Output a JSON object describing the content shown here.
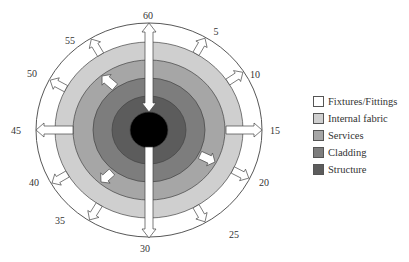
{
  "diagram": {
    "type": "concentric-layers-lifespan",
    "center": [
      149,
      130
    ],
    "outer_ring_label": "Fixtures/Fittings",
    "layers": [
      {
        "name": "Fixtures/Fittings",
        "color": "#ffffff",
        "rx": 113,
        "ry": 107
      },
      {
        "name": "Internal fabric",
        "color": "#cfcfcf",
        "rx": 94,
        "ry": 88
      },
      {
        "name": "Services",
        "color": "#a6a6a6",
        "rx": 76,
        "ry": 70
      },
      {
        "name": "Cladding",
        "color": "#7d7d7d",
        "rx": 56,
        "ry": 52
      },
      {
        "name": "Structure",
        "color": "#5c5c5c",
        "rx": 37,
        "ry": 34
      },
      {
        "name": "Core",
        "color": "#000000",
        "rx": 19,
        "ry": 18
      }
    ],
    "ticks": [
      {
        "label": "60",
        "x": 148,
        "y": 19
      },
      {
        "label": "5",
        "x": 216,
        "y": 35
      },
      {
        "label": "10",
        "x": 255,
        "y": 78
      },
      {
        "label": "15",
        "x": 275,
        "y": 134
      },
      {
        "label": "20",
        "x": 264,
        "y": 186
      },
      {
        "label": "25",
        "x": 234,
        "y": 238
      },
      {
        "label": "30",
        "x": 145,
        "y": 252
      },
      {
        "label": "35",
        "x": 60,
        "y": 224
      },
      {
        "label": "40",
        "x": 34,
        "y": 186
      },
      {
        "label": "45",
        "x": 16,
        "y": 134
      },
      {
        "label": "50",
        "x": 32,
        "y": 77
      },
      {
        "label": "55",
        "x": 70,
        "y": 44
      }
    ]
  },
  "legend": {
    "items": [
      {
        "label": "Fixtures/Fittings",
        "color": "#ffffff"
      },
      {
        "label": "Internal fabric",
        "color": "#cfcfcf"
      },
      {
        "label": "Services",
        "color": "#a6a6a6"
      },
      {
        "label": "Cladding",
        "color": "#7d7d7d"
      },
      {
        "label": "Structure",
        "color": "#5c5c5c"
      }
    ]
  }
}
